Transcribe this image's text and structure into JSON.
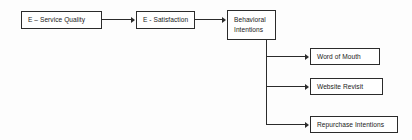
{
  "diagram": {
    "type": "flowchart",
    "title": "",
    "background_color": "#fdfdfd",
    "line_color": "#2b2b2b",
    "nodes": [
      {
        "id": "service-quality",
        "label": "E – Service Quality"
      },
      {
        "id": "satisfaction",
        "label": "E - Satisfaction"
      },
      {
        "id": "behavioral-intentions",
        "label": "Behavioral\nIntentions"
      },
      {
        "id": "word-of-mouth",
        "label": "Word of Mouth"
      },
      {
        "id": "website-revisit",
        "label": "Website Revisit"
      },
      {
        "id": "repurchase-intentions",
        "label": "Repurchase Intentions"
      }
    ],
    "edges": [
      {
        "from": "service-quality",
        "to": "satisfaction"
      },
      {
        "from": "satisfaction",
        "to": "behavioral-intentions"
      },
      {
        "from": "behavioral-intentions",
        "to": "word-of-mouth"
      },
      {
        "from": "behavioral-intentions",
        "to": "website-revisit"
      },
      {
        "from": "behavioral-intentions",
        "to": "repurchase-intentions"
      }
    ]
  }
}
